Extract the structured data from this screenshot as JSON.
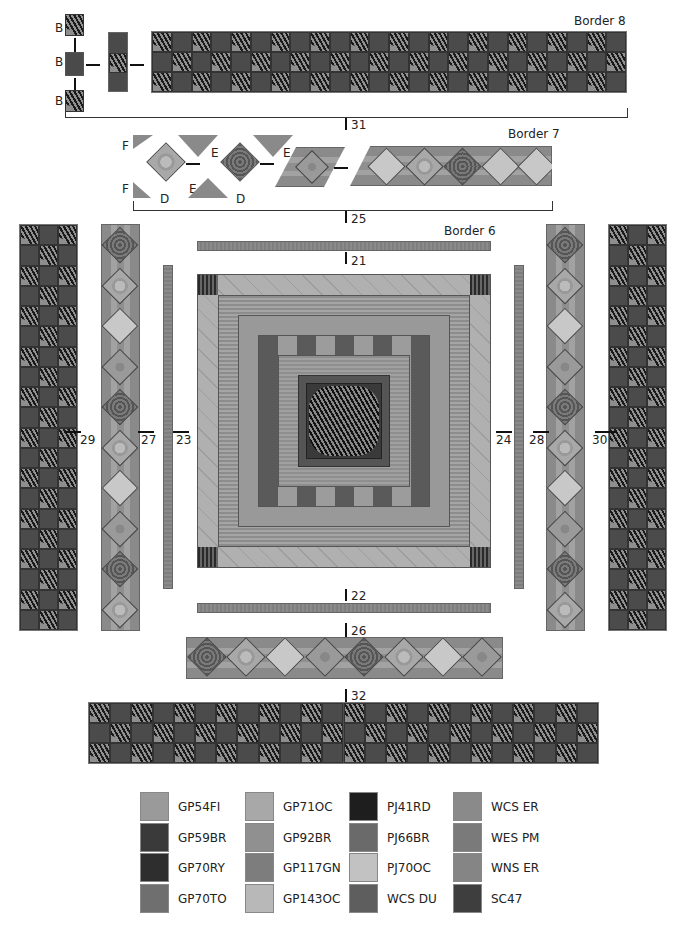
{
  "diagram": {
    "type": "quilt-assembly",
    "title_partial": "Quilt Assembly Overview",
    "borders": [
      {
        "id": "border-8",
        "label": "Border 8"
      },
      {
        "id": "border-7",
        "label": "Border 7"
      },
      {
        "id": "border-6",
        "label": "Border 6"
      }
    ],
    "piece_labels": {
      "b": "B",
      "d": "D",
      "e": "E",
      "f": "F"
    },
    "step_numbers": {
      "s21": "21",
      "s22": "22",
      "s23": "23",
      "s24": "24",
      "s25": "25",
      "s26": "26",
      "s27": "27",
      "s28": "28",
      "s29": "29",
      "s30": "30",
      "s31": "31",
      "s32": "32"
    }
  },
  "legend": {
    "columns": [
      [
        {
          "code": "GP54FI",
          "color": "#9a9a9a"
        },
        {
          "code": "GP59BR",
          "color": "#3a3a3a"
        },
        {
          "code": "GP70RY",
          "color": "#2e2e2e"
        },
        {
          "code": "GP70TO",
          "color": "#6f6f6f"
        }
      ],
      [
        {
          "code": "GP71OC",
          "color": "#a8a8a8"
        },
        {
          "code": "GP92BR",
          "color": "#909090"
        },
        {
          "code": "GP117GN",
          "color": "#7d7d7d"
        },
        {
          "code": "GP143OC",
          "color": "#b8b8b8"
        }
      ],
      [
        {
          "code": "PJ41RD",
          "color": "#1e1e1e"
        },
        {
          "code": "PJ66BR",
          "color": "#6a6a6a"
        },
        {
          "code": "PJ70OC",
          "color": "#c2c2c2"
        },
        {
          "code": "WCS DU",
          "color": "#5e5e5e"
        }
      ],
      [
        {
          "code": "WCS ER",
          "color": "#8a8a8a"
        },
        {
          "code": "WES PM",
          "color": "#7a7a7a"
        },
        {
          "code": "WNS ER",
          "color": "#858585"
        },
        {
          "code": "SC47",
          "color": "#3e3e3e"
        }
      ]
    ]
  }
}
